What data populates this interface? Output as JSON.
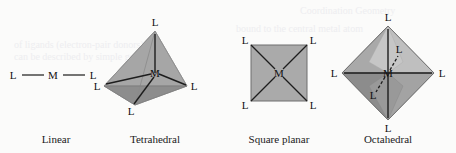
{
  "figure": {
    "background_color": "#fbfbfa",
    "label_color": "#111111",
    "bond_color": "#1a1a1a",
    "metal_label": "M",
    "ligand_label": "L",
    "geometries": [
      {
        "id": "linear",
        "caption": "Linear",
        "caption_x": 56,
        "caption_y": 143,
        "coordination_number": 2,
        "center": {
          "label": "M",
          "x": 53,
          "y": 75
        },
        "ligands": [
          {
            "label": "L",
            "x": 13,
            "y": 75
          },
          {
            "label": "L",
            "x": 93,
            "y": 75
          }
        ],
        "faces": []
      },
      {
        "id": "tetrahedral",
        "caption": "Tetrahedral",
        "caption_x": 155,
        "caption_y": 143,
        "coordination_number": 4,
        "center": {
          "label": "M",
          "x": 155,
          "y": 73
        },
        "ligands": [
          {
            "label": "L",
            "x": 155,
            "y": 26
          },
          {
            "label": "L",
            "x": 97,
            "y": 87
          },
          {
            "label": "L",
            "x": 193,
            "y": 87
          },
          {
            "label": "L",
            "x": 131,
            "y": 112
          }
        ],
        "faces": [
          {
            "name": "left-face",
            "color": "#b6b6b6"
          },
          {
            "name": "right-face",
            "color": "#a0a0a0"
          },
          {
            "name": "front-face",
            "color": "#c9c9c9"
          },
          {
            "name": "base-face",
            "color": "#8f8f8f"
          }
        ]
      },
      {
        "id": "square-planar",
        "caption": "Square planar",
        "caption_x": 279,
        "caption_y": 143,
        "coordination_number": 4,
        "center": {
          "label": "M",
          "x": 279,
          "y": 73
        },
        "ligands": [
          {
            "label": "L",
            "x": 247,
            "y": 41
          },
          {
            "label": "L",
            "x": 311,
            "y": 41
          },
          {
            "label": "L",
            "x": 247,
            "y": 105
          },
          {
            "label": "L",
            "x": 311,
            "y": 105
          }
        ],
        "faces": [
          {
            "name": "square-plane",
            "color": "#aaaaaa"
          }
        ]
      },
      {
        "id": "octahedral",
        "caption": "Octahedral",
        "caption_x": 388,
        "caption_y": 143,
        "coordination_number": 6,
        "center": {
          "label": "M",
          "x": 388,
          "y": 73
        },
        "ligands": [
          {
            "label": "L",
            "x": 388,
            "y": 20
          },
          {
            "label": "L",
            "x": 388,
            "y": 126
          },
          {
            "label": "L",
            "x": 335,
            "y": 73
          },
          {
            "label": "L",
            "x": 441,
            "y": 73
          },
          {
            "label": "L",
            "x": 398,
            "y": 51
          },
          {
            "label": "L",
            "x": 374,
            "y": 97
          }
        ],
        "faces": [
          {
            "name": "upper-left-face",
            "color": "#a8a8a8"
          },
          {
            "name": "upper-right-face",
            "color": "#bdbdbd"
          },
          {
            "name": "lower-left-face",
            "color": "#8d8d8d"
          },
          {
            "name": "lower-right-face",
            "color": "#a2a2a2"
          },
          {
            "name": "front-upper-face",
            "color": "#c4c4c4"
          },
          {
            "name": "front-lower-face",
            "color": "#9a9a9a"
          }
        ]
      }
    ],
    "background_bleed_text": [
      {
        "text": "of ligands (electron-pair donors) and",
        "x": 14,
        "y": 48,
        "size": 10
      },
      {
        "text": "can be described by simple geometry",
        "x": 14,
        "y": 60,
        "size": 10
      },
      {
        "text": "Coordination Geometry",
        "x": 300,
        "y": 14,
        "size": 10
      },
      {
        "text": "bound to the central metal atom",
        "x": 236,
        "y": 32,
        "size": 10
      }
    ]
  }
}
